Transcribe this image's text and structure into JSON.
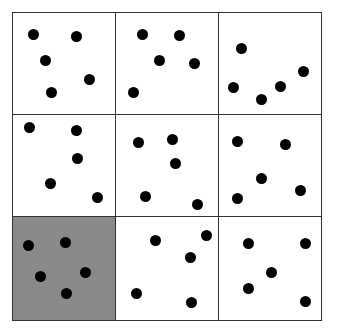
{
  "diagram": {
    "type": "dot-grid",
    "rows": 3,
    "cols": 3,
    "grid_bounds": {
      "left": 12,
      "top": 12,
      "right": 321,
      "bottom": 320
    },
    "col_edges": [
      12,
      115,
      218,
      321
    ],
    "row_edges": [
      12,
      114,
      216,
      320
    ],
    "colors": {
      "border": "#333333",
      "cell_bg": "#ffffff",
      "highlight_bg": "#8a8a8a",
      "dot": "#000000"
    },
    "cells": [
      {
        "row": 0,
        "col": 0,
        "highlighted": false,
        "dot_count": 5,
        "dots": [
          [
            33,
            34
          ],
          [
            76,
            36
          ],
          [
            45,
            60
          ],
          [
            89,
            79
          ],
          [
            51,
            92
          ]
        ]
      },
      {
        "row": 0,
        "col": 1,
        "highlighted": false,
        "dot_count": 5,
        "dots": [
          [
            142,
            34
          ],
          [
            179,
            35
          ],
          [
            159,
            60
          ],
          [
            194,
            63
          ],
          [
            133,
            92
          ]
        ]
      },
      {
        "row": 0,
        "col": 2,
        "highlighted": false,
        "dot_count": 5,
        "dots": [
          [
            241,
            48
          ],
          [
            233,
            87
          ],
          [
            261,
            99
          ],
          [
            280,
            86
          ],
          [
            303,
            71
          ]
        ]
      },
      {
        "row": 1,
        "col": 0,
        "highlighted": false,
        "dot_count": 5,
        "dots": [
          [
            29,
            127
          ],
          [
            76,
            130
          ],
          [
            77,
            158
          ],
          [
            50,
            183
          ],
          [
            97,
            197
          ]
        ]
      },
      {
        "row": 1,
        "col": 1,
        "highlighted": false,
        "dot_count": 5,
        "dots": [
          [
            138,
            142
          ],
          [
            172,
            139
          ],
          [
            175,
            163
          ],
          [
            145,
            196
          ],
          [
            197,
            204
          ]
        ]
      },
      {
        "row": 1,
        "col": 2,
        "highlighted": false,
        "dot_count": 5,
        "dots": [
          [
            237,
            141
          ],
          [
            285,
            144
          ],
          [
            261,
            178
          ],
          [
            300,
            190
          ],
          [
            237,
            198
          ]
        ]
      },
      {
        "row": 2,
        "col": 0,
        "highlighted": true,
        "dot_count": 5,
        "dots": [
          [
            28,
            245
          ],
          [
            65,
            242
          ],
          [
            40,
            276
          ],
          [
            85,
            272
          ],
          [
            66,
            293
          ]
        ]
      },
      {
        "row": 2,
        "col": 1,
        "highlighted": false,
        "dot_count": 5,
        "dots": [
          [
            155,
            240
          ],
          [
            206,
            235
          ],
          [
            190,
            257
          ],
          [
            136,
            293
          ],
          [
            191,
            302
          ]
        ]
      },
      {
        "row": 2,
        "col": 2,
        "highlighted": false,
        "dot_count": 5,
        "dots": [
          [
            248,
            243
          ],
          [
            305,
            243
          ],
          [
            271,
            272
          ],
          [
            248,
            288
          ],
          [
            305,
            301
          ]
        ]
      }
    ]
  }
}
